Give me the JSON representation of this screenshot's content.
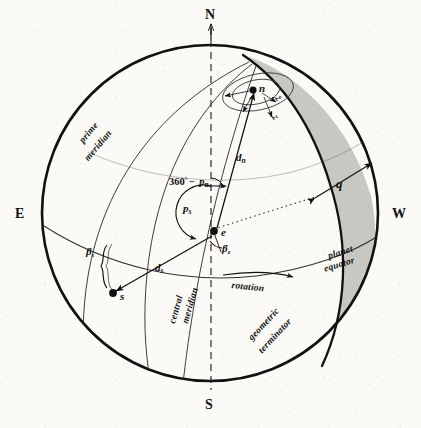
{
  "figure": {
    "type": "diagram"
  },
  "colors": {
    "ink": "#111111",
    "line": "#222222",
    "shade": "#c9c7c2",
    "paper": "#fbfaf7"
  },
  "cardinals": {
    "north": "N",
    "south": "S",
    "east": "E",
    "west": "W"
  },
  "curve_labels": {
    "prime_meridian_line1": "prime",
    "prime_meridian_line2": "meridian",
    "central_meridian_line1": "central",
    "central_meridian_line2": "meridian",
    "planet_equator_line1": "planet",
    "planet_equator_line2": "equator",
    "geometric_terminator_line1": "geometric",
    "geometric_terminator_line2": "terminator",
    "rotation": "rotation"
  },
  "points": {
    "north_pole": "n",
    "sub_earth": "e",
    "sub_solar": "s"
  },
  "measures": {
    "crescent_width": "q",
    "distance_north": "d",
    "distance_north_sub": "n",
    "distance_solar": "d",
    "distance_solar_sub": "s",
    "position_angle_solar": "p",
    "position_angle_solar_sub": "s",
    "position_angle_north_expr_pre": "360",
    "position_angle_north_expr_deg": "°",
    "position_angle_north_expr_minus": "− ",
    "position_angle_north_expr_p": "p",
    "position_angle_north_expr_sub": "n",
    "beta_solar": "β",
    "beta_solar_sub": "s",
    "beta_earth": "β",
    "beta_earth_sub": "e",
    "lambda_inner": "λ",
    "lambda_inner_sub": "n",
    "lambda_outer": "λ",
    "lambda_outer_sub": "e"
  }
}
